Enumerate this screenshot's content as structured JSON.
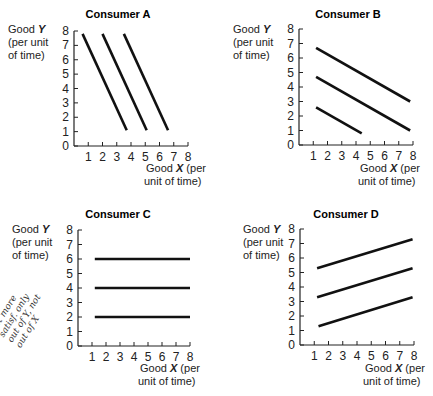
{
  "chart_data": [
    {
      "type": "line",
      "title": "Consumer A",
      "ylabel": "Good Y (per unit of time)",
      "xlabel": "Good X (per unit of time)",
      "xlim": [
        0,
        8
      ],
      "ylim": [
        0,
        8
      ],
      "xticks": [
        1,
        2,
        3,
        4,
        5,
        6,
        7,
        8
      ],
      "yticks": [
        0,
        1,
        2,
        3,
        4,
        5,
        6,
        7,
        8
      ],
      "grid": false,
      "series": [
        {
          "name": "curve 1",
          "x": [
            0.6,
            3.7
          ],
          "y": [
            7.8,
            1.1
          ]
        },
        {
          "name": "curve 2",
          "x": [
            2.0,
            5.1
          ],
          "y": [
            7.8,
            1.1
          ]
        },
        {
          "name": "curve 3",
          "x": [
            3.5,
            6.6
          ],
          "y": [
            7.8,
            1.1
          ]
        }
      ]
    },
    {
      "type": "line",
      "title": "Consumer B",
      "ylabel": "Good Y (per unit of time)",
      "xlabel": "Good X (per unit of time)",
      "xlim": [
        0,
        8
      ],
      "ylim": [
        0,
        8
      ],
      "xticks": [
        1,
        2,
        3,
        4,
        5,
        6,
        7,
        8
      ],
      "yticks": [
        0,
        1,
        2,
        3,
        4,
        5,
        6,
        7,
        8
      ],
      "grid": false,
      "series": [
        {
          "name": "curve 1",
          "x": [
            1.2,
            4.4
          ],
          "y": [
            2.6,
            0.8
          ]
        },
        {
          "name": "curve 2",
          "x": [
            1.2,
            7.8
          ],
          "y": [
            4.7,
            1.0
          ]
        },
        {
          "name": "curve 3",
          "x": [
            1.2,
            7.8
          ],
          "y": [
            6.7,
            3.0
          ]
        }
      ]
    },
    {
      "type": "line",
      "title": "Consumer C",
      "ylabel": "Good Y (per unit of time)",
      "xlabel": "Good X (per unit of time)",
      "xlim": [
        0,
        8
      ],
      "ylim": [
        0,
        8
      ],
      "xticks": [
        1,
        2,
        3,
        4,
        5,
        6,
        7,
        8
      ],
      "yticks": [
        0,
        1,
        2,
        3,
        4,
        5,
        6,
        7,
        8
      ],
      "grid": false,
      "series": [
        {
          "name": "curve 1",
          "x": [
            1.2,
            8.0
          ],
          "y": [
            2,
            2
          ]
        },
        {
          "name": "curve 2",
          "x": [
            1.2,
            8.0
          ],
          "y": [
            4,
            4
          ]
        },
        {
          "name": "curve 3",
          "x": [
            1.2,
            8.0
          ],
          "y": [
            6,
            6
          ]
        }
      ],
      "annotation": "get more satisfaction only out of Y, not out of X (handwritten)"
    },
    {
      "type": "line",
      "title": "Consumer D",
      "ylabel": "Good Y (per unit of time)",
      "xlabel": "Good X (per unit of time)",
      "xlim": [
        0,
        8
      ],
      "ylim": [
        0,
        8
      ],
      "xticks": [
        1,
        2,
        3,
        4,
        5,
        6,
        7,
        8
      ],
      "yticks": [
        0,
        1,
        2,
        3,
        4,
        5,
        6,
        7,
        8
      ],
      "grid": false,
      "series": [
        {
          "name": "curve 1",
          "x": [
            1.3,
            7.9
          ],
          "y": [
            1.3,
            3.3
          ]
        },
        {
          "name": "curve 2",
          "x": [
            1.2,
            7.9
          ],
          "y": [
            3.3,
            5.3
          ]
        },
        {
          "name": "curve 3",
          "x": [
            1.2,
            7.9
          ],
          "y": [
            5.3,
            7.3
          ]
        }
      ]
    }
  ],
  "labels": {
    "ylabel_1": "Good ",
    "ylabel_var": "Y",
    "ylabel_2": "(per unit",
    "ylabel_3": "of time)",
    "xlabel_1": "Good ",
    "xlabel_var": "X",
    "xlabel_1b": " (per",
    "xlabel_2": "unit of time)"
  },
  "handwritten_note": "get more satisf. only out of Y, not out of X"
}
